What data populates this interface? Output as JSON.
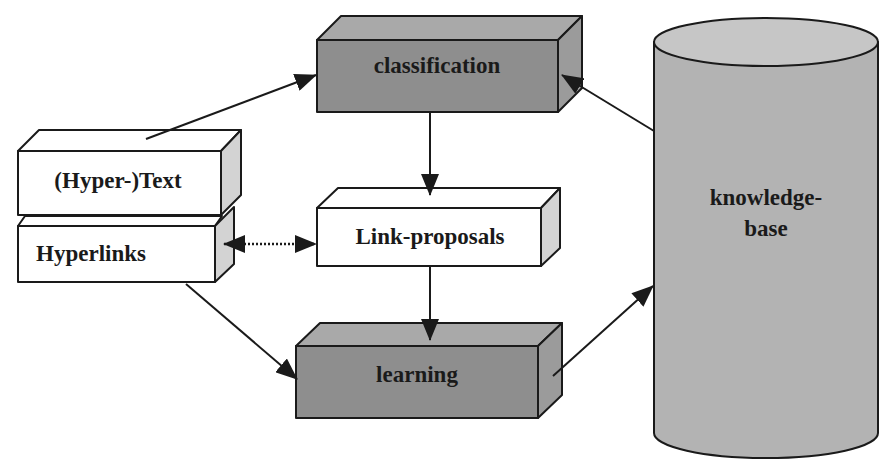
{
  "diagram": {
    "colors": {
      "dark_front": "#8e8e8e",
      "dark_top": "#a9a9a9",
      "dark_side": "#9b9b9b",
      "light_front": "#ffffff",
      "light_top": "#ffffff",
      "light_side": "#d3d3d3",
      "cylinder_body": "#b3b3b3",
      "cylinder_top": "#c6c6c6",
      "line": "#1a1a1a"
    },
    "nodes": {
      "classification": {
        "label": "classification",
        "style": "dark-box"
      },
      "hypertext": {
        "label": "(Hyper-)Text",
        "style": "light-box"
      },
      "hyperlinks": {
        "label": "Hyperlinks",
        "style": "light-box"
      },
      "link_proposals": {
        "label": "Link-proposals",
        "style": "light-box"
      },
      "learning": {
        "label": "learning",
        "style": "dark-box"
      },
      "knowledge_base": {
        "label_line1": "knowledge-",
        "label_line2": "base",
        "style": "cylinder"
      }
    },
    "edges": [
      {
        "from": "hypertext",
        "to": "classification",
        "style": "solid",
        "direction": "forward"
      },
      {
        "from": "knowledge_base",
        "to": "classification",
        "style": "solid",
        "direction": "forward"
      },
      {
        "from": "classification",
        "to": "link_proposals",
        "style": "solid",
        "direction": "forward"
      },
      {
        "from": "hyperlinks",
        "to": "link_proposals",
        "style": "dotted",
        "direction": "both"
      },
      {
        "from": "link_proposals",
        "to": "learning",
        "style": "solid",
        "direction": "forward"
      },
      {
        "from": "hyperlinks",
        "to": "learning",
        "style": "solid",
        "direction": "forward"
      },
      {
        "from": "learning",
        "to": "knowledge_base",
        "style": "solid",
        "direction": "forward"
      }
    ]
  }
}
